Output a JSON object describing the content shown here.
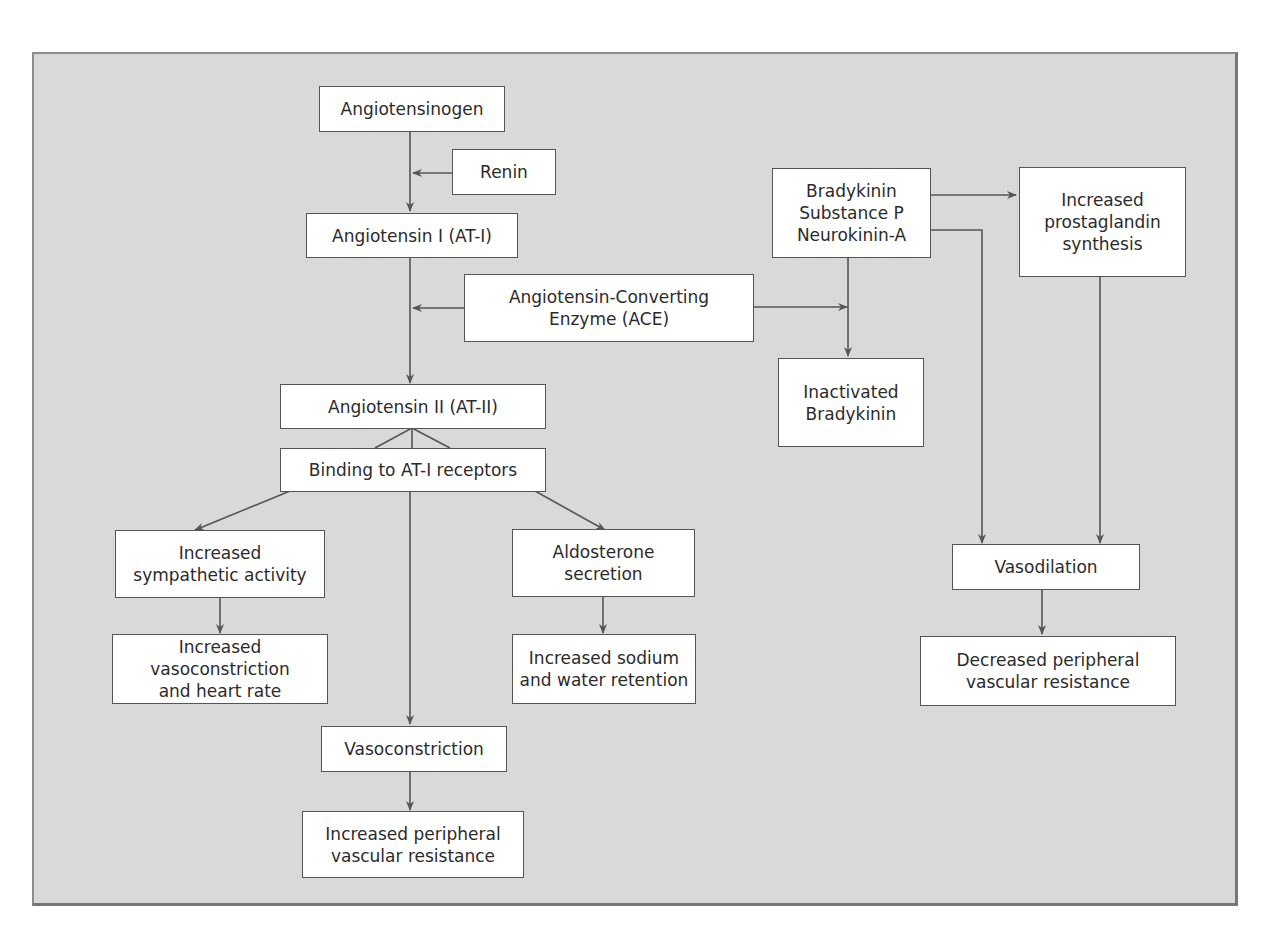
{
  "diagram": {
    "nodes": {
      "angiotensinogen": "Angiotensinogen",
      "renin": "Renin",
      "angiotensin_i": "Angiotensin I (AT-I)",
      "ace": "Angiotensin-Converting\nEnzyme (ACE)",
      "angiotensin_ii": "Angiotensin II (AT-II)",
      "binding": "Binding to AT-I receptors",
      "sympathetic": "Increased\nsympathetic activity",
      "vasoconstriction_hr": "Increased vasoconstriction\nand heart rate",
      "aldosterone": "Aldosterone\nsecretion",
      "sodium_water": "Increased sodium\nand water retention",
      "vasoconstriction": "Vasoconstriction",
      "increased_pvr": "Increased peripheral\nvascular resistance",
      "bradykinin": "Bradykinin\nSubstance P\nNeurokinin-A",
      "prostaglandin": "Increased\nprostaglandin\nsynthesis",
      "inactivated_bradykinin": "Inactivated\nBradykinin",
      "vasodilation": "Vasodilation",
      "decreased_pvr": "Decreased peripheral\nvascular resistance"
    },
    "colors": {
      "background": "#d9d9d9",
      "box_fill": "#ffffff",
      "line": "#555555"
    }
  }
}
